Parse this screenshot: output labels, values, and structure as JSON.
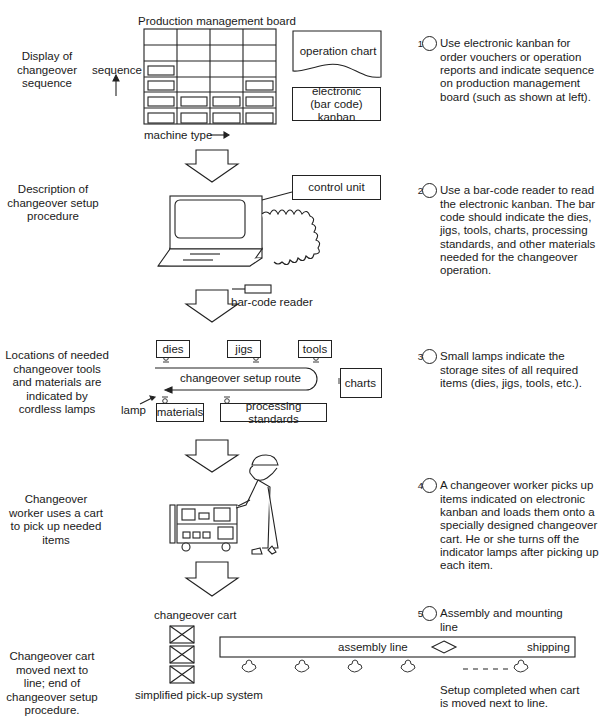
{
  "steps": [
    {
      "left_label": "Display of changeover sequence",
      "number": "1",
      "description": "Use electronic kanban for order vouchers or operation reports and indicate sequence on production management board (such as shown at left)."
    },
    {
      "left_label": "Description of changeover setup procedure",
      "number": "2",
      "description": "Use a bar-code reader to read the electronic kanban. The bar code should indicate the dies, jigs, tools, charts, processing standards, and other materials needed for the changeover operation."
    },
    {
      "left_label": "Locations of needed changeover tools and materials are indicated by cordless lamps",
      "number": "3",
      "description": "Small lamps indicate the storage sites of all required items (dies, jigs, tools, etc.)."
    },
    {
      "left_label": "Changeover worker uses a cart to pick up needed items",
      "number": "4",
      "description": "A changeover worker picks up items indicated on electronic kanban and loads them onto a specially designed changeover cart. He or she turns off the indicator lamps after picking up each item."
    },
    {
      "left_label": "Changeover cart moved next to line; end of changeover setup procedure.",
      "number": "5",
      "description": "Assembly and mounting line"
    }
  ],
  "board": {
    "title": "Production management board",
    "y_axis": "sequence",
    "x_axis": "machine type",
    "operation_chart": "operation chart",
    "kanban": "electronic (bar code) kanban"
  },
  "computer": {
    "control_unit": "control unit",
    "reader": "bar-code reader"
  },
  "storage": {
    "dies": "dies",
    "jigs": "jigs",
    "tools": "tools",
    "charts": "charts",
    "materials": "materials",
    "processing_standards": "processing standards",
    "route": "changeover setup route",
    "lamp": "lamp"
  },
  "line": {
    "cart_label": "changeover cart",
    "pickup": "simplified pick-up system",
    "assembly": "assembly line",
    "shipping": "shipping",
    "completed": "Setup completed when cart is moved next to line."
  }
}
